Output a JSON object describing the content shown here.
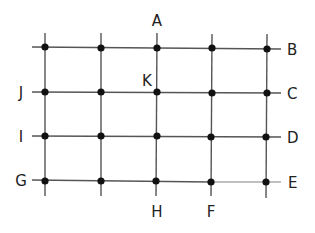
{
  "diagram": {
    "type": "grid-graph",
    "columns_x": [
      45,
      101,
      157,
      211,
      267
    ],
    "rows_y": [
      48,
      92,
      136,
      181
    ],
    "line_color": "#555555",
    "node_color": "#111111",
    "labels": {
      "A": "A",
      "B": "B",
      "C": "C",
      "D": "D",
      "E": "E",
      "F": "F",
      "G": "G",
      "H": "H",
      "I": "I",
      "J": "J",
      "K": "K"
    }
  }
}
